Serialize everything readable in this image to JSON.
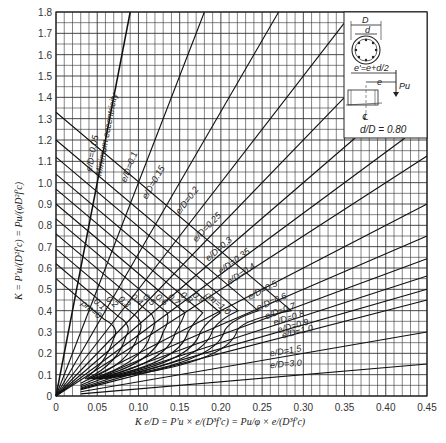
{
  "chart_data": {
    "type": "line",
    "xlabel": "K e/D = P'u × e/(D³f'c) = (Pu/φ) × e/(D³f'c)",
    "ylabel": "K = P'u/(D²f'c) = Pu/(φD²f'c)",
    "xlim": [
      0,
      0.45
    ],
    "ylim": [
      0,
      1.8
    ],
    "x_ticks": [
      "0",
      "0.05",
      "0.10",
      "0.15",
      "0.20",
      "0.25",
      "0.30",
      "0.35",
      "0.40",
      "0.45"
    ],
    "y_ticks": [
      "0",
      "0.1",
      "0.2",
      "0.3",
      "0.4",
      "0.5",
      "0.6",
      "0.7",
      "0.8",
      "0.9",
      "1.0",
      "1.1",
      "1.2",
      "1.3",
      "1.4",
      "1.5",
      "1.6",
      "1.7",
      "1.8"
    ],
    "grid": {
      "x_minor_step": 0.01,
      "y_minor_step": 0.05,
      "on": true
    },
    "eccentricity_lines": [
      {
        "label": "e/D = 0.05",
        "e_over_D": 0.05,
        "note": "Minimum eccentricity"
      },
      {
        "label": "e/D = 0.1",
        "e_over_D": 0.1
      },
      {
        "label": "e/D = 0.15",
        "e_over_D": 0.15
      },
      {
        "label": "e/D = 0.2",
        "e_over_D": 0.2
      },
      {
        "label": "e/D = 0.25",
        "e_over_D": 0.25
      },
      {
        "label": "e/D = 0.3",
        "e_over_D": 0.3
      },
      {
        "label": "e/D = 0.35",
        "e_over_D": 0.35
      },
      {
        "label": "e/D = 0.4",
        "e_over_D": 0.4
      },
      {
        "label": "e/D = 0.5",
        "e_over_D": 0.5
      },
      {
        "label": "e/D = 0.6",
        "e_over_D": 0.6
      },
      {
        "label": "e/D = 0.7",
        "e_over_D": 0.7
      },
      {
        "label": "e/D = 0.8",
        "e_over_D": 0.8
      },
      {
        "label": "e/D = 0.9",
        "e_over_D": 0.9
      },
      {
        "label": "e/D = 1.0",
        "e_over_D": 1.0
      },
      {
        "label": "e/D = 1.5",
        "e_over_D": 1.5
      },
      {
        "label": "e/D = 3.0",
        "e_over_D": 3.0
      }
    ],
    "rho_m_curves": [
      {
        "label": "ρm = 0",
        "rho_m": 0.0,
        "K_at_axis": 0.55,
        "knee": [
          0.07,
          0.3
        ],
        "end": [
          0.035,
          0.08
        ]
      },
      {
        "label": "0.1",
        "rho_m": 0.1,
        "K_at_axis": 0.62,
        "knee": [
          0.085,
          0.31
        ],
        "end": [
          0.037,
          0.08
        ]
      },
      {
        "label": "0.2",
        "rho_m": 0.2,
        "K_at_axis": 0.69,
        "knee": [
          0.1,
          0.32
        ],
        "end": [
          0.039,
          0.08
        ]
      },
      {
        "label": "0.3",
        "rho_m": 0.3,
        "K_at_axis": 0.76,
        "knee": [
          0.115,
          0.32
        ],
        "end": [
          0.041,
          0.08
        ]
      },
      {
        "label": "0.4",
        "rho_m": 0.4,
        "K_at_axis": 0.83,
        "knee": [
          0.13,
          0.33
        ],
        "end": [
          0.043,
          0.08
        ]
      },
      {
        "label": "0.5",
        "rho_m": 0.5,
        "K_at_axis": 0.9,
        "knee": [
          0.145,
          0.33
        ],
        "end": [
          0.045,
          0.08
        ]
      },
      {
        "label": "0.6",
        "rho_m": 0.6,
        "K_at_axis": 0.97,
        "knee": [
          0.16,
          0.33
        ],
        "end": [
          0.047,
          0.08
        ]
      },
      {
        "label": "0.7",
        "rho_m": 0.7,
        "K_at_axis": 1.04,
        "knee": [
          0.175,
          0.33
        ],
        "end": [
          0.049,
          0.08
        ]
      },
      {
        "label": "0.8",
        "rho_m": 0.8,
        "K_at_axis": 1.12,
        "knee": [
          0.19,
          0.34
        ],
        "end": [
          0.051,
          0.08
        ]
      },
      {
        "label": "0.9",
        "rho_m": 0.9,
        "K_at_axis": 1.2,
        "knee": [
          0.205,
          0.34
        ],
        "end": [
          0.053,
          0.08
        ]
      },
      {
        "label": "ρm = 1.0",
        "rho_m": 1.0,
        "K_at_axis": 1.33,
        "knee": [
          0.22,
          0.34
        ],
        "end": [
          0.055,
          0.08
        ]
      }
    ],
    "annotations": [
      "Minimum eccentricity",
      "d/D = 0.80",
      "D",
      "d",
      "e' = e + d/2",
      "e",
      "Pu",
      "℄"
    ]
  },
  "inset": {
    "D_label": "D",
    "d_label": "d",
    "eprime_label": "e'=e+d/2",
    "e_label": "e",
    "pu_label": "Pu",
    "cl_label": "℄",
    "ratio_label": "d/D = 0.80"
  },
  "labels": {
    "min_ecc": "Minimum eccentricity",
    "x_axis_title": "K e/D = P'u × e/(D³f'c) = Pu/φ × e/(D³f'c)",
    "y_axis_title": "K = P'u/(D²f'c) = Pu/(φD²f'c)"
  }
}
